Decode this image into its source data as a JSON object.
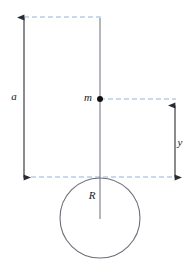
{
  "figure": {
    "type": "physics-diagram",
    "background_color": "#ffffff",
    "width": 188,
    "height": 267,
    "labels": {
      "a": "a",
      "m": "m",
      "y": "y",
      "R": "R"
    },
    "colors": {
      "dimension_line": "#2b2b33",
      "axis_line": "#7a7a86",
      "dashed_guide": "#8fb4d9",
      "circle_stroke": "#6e6e7a",
      "point_fill": "#111111",
      "label_text": "#1a1a1a"
    },
    "geometry": {
      "dimension_a": {
        "x": 24,
        "y_top": 16,
        "y_bottom": 178,
        "label_position": {
          "x": 14,
          "y": 97
        },
        "arrows": "both"
      },
      "dimension_y": {
        "x": 175,
        "y_top": 104,
        "y_bottom": 178,
        "label_position": {
          "x": 180,
          "y": 143
        },
        "arrows": "both"
      },
      "center_axis": {
        "x": 100,
        "y_top": 18,
        "y_bottom": 219
      },
      "point_mass": {
        "x": 100,
        "y": 99,
        "radius": 3,
        "label_position": {
          "x": 88,
          "y": 98
        }
      },
      "sphere": {
        "cx": 100,
        "cy": 218,
        "r": 40,
        "radius_label_position": {
          "x": 92,
          "y": 196
        }
      },
      "guides": [
        {
          "name": "top-guide",
          "x1": 24,
          "x2": 101,
          "y": 17
        },
        {
          "name": "middle-guide",
          "x1": 100,
          "x2": 176,
          "y": 99
        },
        {
          "name": "bottom-guide",
          "x1": 23,
          "x2": 176,
          "y": 177
        }
      ]
    }
  }
}
